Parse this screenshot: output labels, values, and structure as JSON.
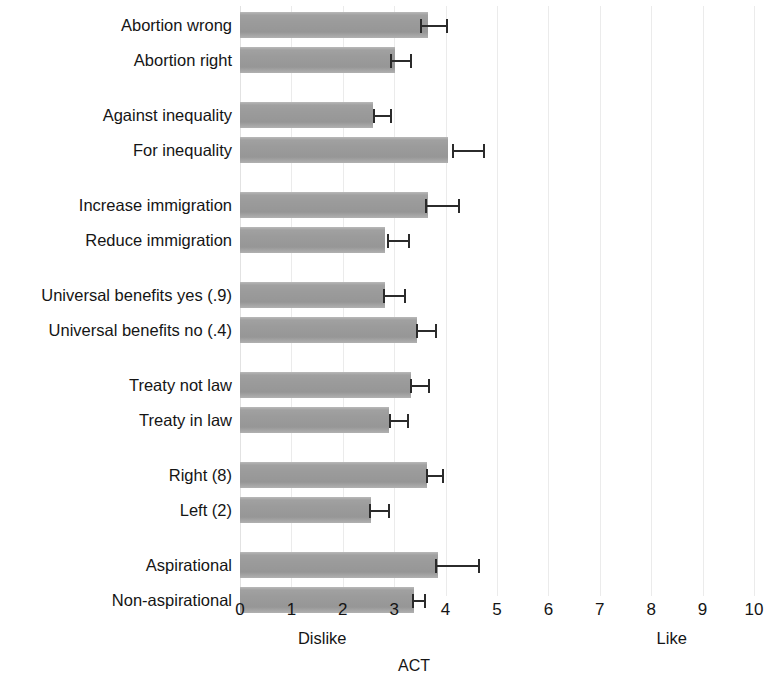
{
  "chart_data": {
    "type": "bar",
    "orientation": "horizontal",
    "title": "",
    "xlabel": "ACT",
    "ylabel": "",
    "xlim": [
      0,
      10
    ],
    "xticks": [
      "0",
      "1",
      "2",
      "3",
      "4",
      "5",
      "6",
      "7",
      "8",
      "9",
      "10"
    ],
    "grid": true,
    "grid_axis": "x",
    "legend": "none",
    "error_bars": "95% confidence interval",
    "annotations": [
      {
        "text": "Dislike",
        "x": 1.6,
        "position": "below-axis"
      },
      {
        "text": "Like",
        "x": 8.4,
        "position": "below-axis"
      }
    ],
    "bar_color": "#9b9b9b",
    "error_color": "#2b2b2b",
    "grid_color": "#ebebeb",
    "categories": [
      "Abortion wrong",
      "Abortion right",
      "Against inequality",
      "For inequality",
      "Increase immigration",
      "Reduce immigration",
      "Universal benefits yes  (.9)",
      "Universal benefits no (.4)",
      "Treaty not law",
      "Treaty in law",
      "Right (8)",
      "Left (2)",
      "Aspirational",
      "Non-aspirational"
    ],
    "groups": [
      {
        "name": "Abortion",
        "bars": [
          {
            "label": "Abortion wrong",
            "value": 3.66,
            "ci_low": 3.5,
            "ci_high": 4.05
          },
          {
            "label": "Abortion right",
            "value": 3.01,
            "ci_low": 2.92,
            "ci_high": 3.35
          }
        ]
      },
      {
        "name": "Inequality",
        "bars": [
          {
            "label": "Against inequality",
            "value": 2.59,
            "ci_low": 2.58,
            "ci_high": 2.95
          },
          {
            "label": "For inequality",
            "value": 4.05,
            "ci_low": 4.12,
            "ci_high": 4.76
          }
        ]
      },
      {
        "name": "Immigration",
        "bars": [
          {
            "label": "Increase immigration",
            "value": 3.66,
            "ci_low": 3.6,
            "ci_high": 4.28
          },
          {
            "label": "Reduce immigration",
            "value": 2.82,
            "ci_low": 2.86,
            "ci_high": 3.3
          }
        ]
      },
      {
        "name": "Universal benefits",
        "bars": [
          {
            "label": "Universal benefits yes  (.9)",
            "value": 2.82,
            "ci_low": 2.78,
            "ci_high": 3.22
          },
          {
            "label": "Universal benefits no (.4)",
            "value": 3.44,
            "ci_low": 3.42,
            "ci_high": 3.84
          }
        ]
      },
      {
        "name": "Treaty",
        "bars": [
          {
            "label": "Treaty not law",
            "value": 3.33,
            "ci_low": 3.3,
            "ci_high": 3.7
          },
          {
            "label": "Treaty in law",
            "value": 2.89,
            "ci_low": 2.9,
            "ci_high": 3.28
          }
        ]
      },
      {
        "name": "Left-Right",
        "bars": [
          {
            "label": "Right (8)",
            "value": 3.63,
            "ci_low": 3.62,
            "ci_high": 3.96
          },
          {
            "label": "Left (2)",
            "value": 2.54,
            "ci_low": 2.5,
            "ci_high": 2.92
          }
        ]
      },
      {
        "name": "Aspiration",
        "bars": [
          {
            "label": "Aspirational",
            "value": 3.85,
            "ci_low": 3.8,
            "ci_high": 4.66
          },
          {
            "label": "Non-aspirational",
            "value": 3.38,
            "ci_low": 3.35,
            "ci_high": 3.62
          }
        ]
      }
    ]
  }
}
